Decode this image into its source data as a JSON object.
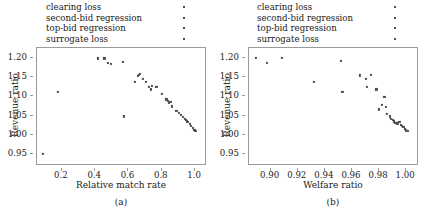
{
  "legend": {
    "entries": [
      {
        "label": "clearing loss",
        "marker": "square-dot-marker",
        "color": "#4d4d55"
      },
      {
        "label": "second-bid regression",
        "marker": "square-dot-marker",
        "color": "#4d4d55"
      },
      {
        "label": "top-bid regression",
        "marker": "square-dot-marker",
        "color": "#4d4d55"
      },
      {
        "label": "surrogate loss",
        "marker": "square-dot-marker",
        "color": "#4d4d55"
      }
    ]
  },
  "chart_data": [
    {
      "type": "scatter",
      "panel": "a",
      "subcaption": "(a)",
      "title": "",
      "xlabel": "Relative match rate",
      "ylabel": "Revenue ratio",
      "xlim": [
        0.05,
        1.06
      ],
      "ylim": [
        0.925,
        1.225
      ],
      "xticks": [
        0.2,
        0.4,
        0.6,
        0.8,
        1.0
      ],
      "xtick_labels": [
        "0.2",
        "0.4",
        "0.6",
        "0.8",
        "1.0"
      ],
      "yticks": [
        0.95,
        1.0,
        1.05,
        1.1,
        1.15,
        1.2
      ],
      "ytick_labels": [
        "0.95",
        "1.00",
        "1.05",
        "1.10",
        "1.15",
        "1.20"
      ],
      "grid": false,
      "legend_position": "above-plot",
      "marker_color": "#4a4a52",
      "points": [
        {
          "x": 0.085,
          "y": 0.952
        },
        {
          "x": 0.175,
          "y": 1.112
        },
        {
          "x": 0.415,
          "y": 1.198
        },
        {
          "x": 0.455,
          "y": 1.198
        },
        {
          "x": 0.478,
          "y": 1.186
        },
        {
          "x": 0.492,
          "y": 1.184
        },
        {
          "x": 0.568,
          "y": 1.19
        },
        {
          "x": 0.572,
          "y": 1.048
        },
        {
          "x": 0.655,
          "y": 1.152
        },
        {
          "x": 0.662,
          "y": 1.156
        },
        {
          "x": 0.668,
          "y": 1.158
        },
        {
          "x": 0.638,
          "y": 1.137
        },
        {
          "x": 0.688,
          "y": 1.146
        },
        {
          "x": 0.705,
          "y": 1.138
        },
        {
          "x": 0.722,
          "y": 1.124
        },
        {
          "x": 0.735,
          "y": 1.118
        },
        {
          "x": 0.742,
          "y": 1.126
        },
        {
          "x": 0.768,
          "y": 1.125
        },
        {
          "x": 0.8,
          "y": 1.106
        },
        {
          "x": 0.828,
          "y": 1.092
        },
        {
          "x": 0.838,
          "y": 1.088
        },
        {
          "x": 0.845,
          "y": 1.082
        },
        {
          "x": 0.852,
          "y": 1.086
        },
        {
          "x": 0.862,
          "y": 1.074
        },
        {
          "x": 0.888,
          "y": 1.062
        },
        {
          "x": 0.905,
          "y": 1.058
        },
        {
          "x": 0.915,
          "y": 1.052
        },
        {
          "x": 0.928,
          "y": 1.046
        },
        {
          "x": 0.938,
          "y": 1.042
        },
        {
          "x": 0.945,
          "y": 1.038
        },
        {
          "x": 0.952,
          "y": 1.035
        },
        {
          "x": 0.958,
          "y": 1.033
        },
        {
          "x": 0.968,
          "y": 1.028
        },
        {
          "x": 0.975,
          "y": 1.024
        },
        {
          "x": 0.985,
          "y": 1.018
        },
        {
          "x": 0.995,
          "y": 1.014
        },
        {
          "x": 1.0,
          "y": 1.012
        },
        {
          "x": 1.005,
          "y": 1.01
        }
      ]
    },
    {
      "type": "scatter",
      "panel": "b",
      "subcaption": "(b)",
      "title": "",
      "xlabel": "Welfare ratio",
      "ylabel": "Revenue ratio",
      "xlim": [
        0.884,
        1.008
      ],
      "ylim": [
        0.925,
        1.225
      ],
      "xticks": [
        0.9,
        0.92,
        0.94,
        0.96,
        0.98,
        1.0
      ],
      "xtick_labels": [
        "0.90",
        "0.92",
        "0.94",
        "0.96",
        "0.98",
        "1.00"
      ],
      "yticks": [
        0.95,
        1.0,
        1.05,
        1.1,
        1.15,
        1.2
      ],
      "ytick_labels": [
        "0.95",
        "1.00",
        "1.05",
        "1.10",
        "1.15",
        "1.20"
      ],
      "grid": false,
      "legend_position": "above-plot",
      "marker_color": "#4a4a52",
      "points": [
        {
          "x": 0.889,
          "y": 1.2
        },
        {
          "x": 0.897,
          "y": 1.186
        },
        {
          "x": 0.908,
          "y": 1.199
        },
        {
          "x": 0.932,
          "y": 1.137
        },
        {
          "x": 0.952,
          "y": 1.192
        },
        {
          "x": 0.953,
          "y": 1.112
        },
        {
          "x": 0.966,
          "y": 1.154
        },
        {
          "x": 0.97,
          "y": 1.146
        },
        {
          "x": 0.971,
          "y": 1.124
        },
        {
          "x": 0.974,
          "y": 1.155
        },
        {
          "x": 0.978,
          "y": 1.118
        },
        {
          "x": 0.98,
          "y": 1.066
        },
        {
          "x": 0.982,
          "y": 1.078
        },
        {
          "x": 0.984,
          "y": 1.098
        },
        {
          "x": 0.985,
          "y": 1.072
        },
        {
          "x": 0.986,
          "y": 1.055
        },
        {
          "x": 0.988,
          "y": 1.048
        },
        {
          "x": 0.989,
          "y": 1.042
        },
        {
          "x": 0.99,
          "y": 1.038
        },
        {
          "x": 0.991,
          "y": 1.035
        },
        {
          "x": 0.992,
          "y": 1.032
        },
        {
          "x": 0.993,
          "y": 1.03
        },
        {
          "x": 0.994,
          "y": 1.028
        },
        {
          "x": 0.995,
          "y": 1.034
        },
        {
          "x": 0.996,
          "y": 1.026
        },
        {
          "x": 0.997,
          "y": 1.024
        },
        {
          "x": 0.998,
          "y": 1.02
        },
        {
          "x": 0.999,
          "y": 1.016
        },
        {
          "x": 1.0,
          "y": 1.012
        },
        {
          "x": 1.001,
          "y": 1.01
        }
      ]
    }
  ]
}
